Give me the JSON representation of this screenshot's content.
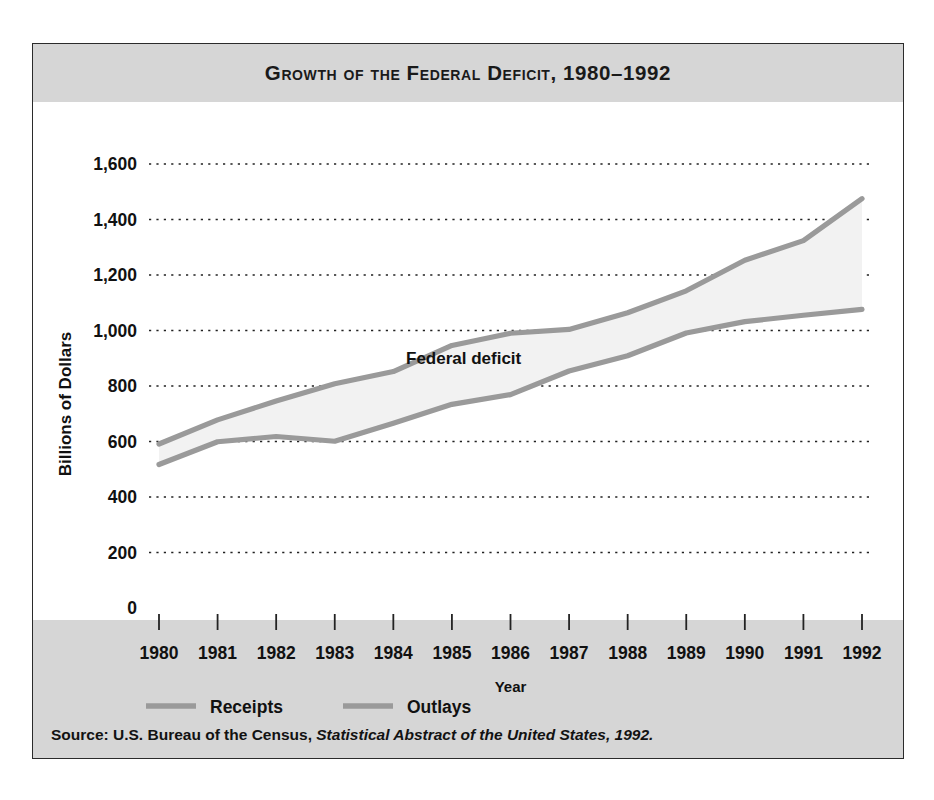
{
  "figure": {
    "title": "Growth of the Federal Deficit, 1980–1992",
    "source_prefix": "Source: U.S. Bureau of the Census, ",
    "source_italic": "Statistical Abstract of the United States, 1992.",
    "annotation": "Federal deficit",
    "caption_below": "Note: being a graph of the deficit: an inc. in the deficit"
  },
  "colors": {
    "band_gray": "#d6d6d6",
    "line_gray": "#9a9a9a",
    "fill_gray": "#f2f2f2",
    "text_black": "#111111",
    "frame_border": "#2b2b2b"
  },
  "legend": {
    "items": [
      {
        "label": "Receipts",
        "color": "#9a9a9a"
      },
      {
        "label": "Outlays",
        "color": "#9a9a9a"
      }
    ]
  },
  "chart_data": {
    "type": "line",
    "title": "Growth of the Federal Deficit, 1980–1992",
    "xlabel": "Year",
    "ylabel": "Billions of Dollars",
    "categories": [
      1980,
      1981,
      1982,
      1983,
      1984,
      1985,
      1986,
      1987,
      1988,
      1989,
      1990,
      1991,
      1992
    ],
    "xtick_labels": [
      "1980",
      "1981",
      "1982",
      "1983",
      "1984",
      "1985",
      "1986",
      "1987",
      "1988",
      "1989",
      "1990",
      "1991",
      "1992"
    ],
    "ytick_labels": [
      "0",
      "200",
      "400",
      "600",
      "800",
      "1,000",
      "1,200",
      "1,400",
      "1,600"
    ],
    "ytick_values": [
      0,
      200,
      400,
      600,
      800,
      1000,
      1200,
      1400,
      1600
    ],
    "ylim": [
      0,
      1700
    ],
    "grid": "horizontal-dotted",
    "legend_position": "bottom-left",
    "annotations": [
      {
        "text": "Federal deficit",
        "x": 1985.2,
        "y": 880
      }
    ],
    "series": [
      {
        "name": "Receipts",
        "color": "#9a9a9a",
        "values": [
          517,
          599,
          618,
          601,
          666,
          734,
          769,
          854,
          909,
          991,
          1032,
          1055,
          1076
        ]
      },
      {
        "name": "Outlays",
        "color": "#9a9a9a",
        "values": [
          591,
          678,
          746,
          808,
          852,
          946,
          990,
          1004,
          1064,
          1143,
          1253,
          1324,
          1475
        ]
      }
    ]
  }
}
